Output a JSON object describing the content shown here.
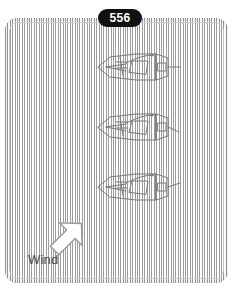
{
  "figure": {
    "page_badge": "556",
    "caption_label": "Wind",
    "frame_color": "#b9b9b9",
    "badge_bg": "#111111",
    "badge_text_color": "#ffffff",
    "line_color": "#7a7a7a",
    "background": "#ffffff",
    "boats": [
      {
        "name": "boat-top",
        "x": 96,
        "y": 50,
        "tiller_angle_deg": 0,
        "description": "sailboat-top-view"
      },
      {
        "name": "boat-middle",
        "x": 96,
        "y": 110,
        "tiller_angle_deg": 20,
        "description": "sailboat-top-view"
      },
      {
        "name": "boat-bottom",
        "x": 96,
        "y": 170,
        "tiller_angle_deg": -14,
        "description": "sailboat-top-view"
      }
    ],
    "wind": {
      "label": "Wind",
      "arrow_direction": "up-right",
      "arrow_angle_deg": 45,
      "arrow_fill": "#ffffff",
      "arrow_stroke": "#9a9a9a"
    },
    "icons": {
      "wind_arrow": "arrow-up-right-icon",
      "boat": "sailboat-icon"
    }
  }
}
